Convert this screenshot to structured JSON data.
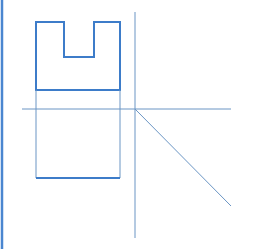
{
  "diagram": {
    "type": "orthographic-projection",
    "colors": {
      "thick": "#3d7cc9",
      "thin": "#6a95c4",
      "border": "#4a86d0",
      "background": "#ffffff"
    },
    "left_border": {
      "x": 2,
      "y1": 0,
      "y2": 249
    },
    "front_view_u_shape": {
      "points": [
        [
          36,
          22
        ],
        [
          64,
          22
        ],
        [
          64,
          57
        ],
        [
          94,
          57
        ],
        [
          94,
          22
        ],
        [
          120,
          22
        ],
        [
          120,
          90
        ],
        [
          36,
          90
        ]
      ]
    },
    "top_view_rect": {
      "x1": 36,
      "y1": 109,
      "x2": 120,
      "y2": 178
    },
    "projection_lines": {
      "left": {
        "x": 36,
        "y1": 90,
        "y2": 178
      },
      "right": {
        "x": 120,
        "y1": 90,
        "y2": 178
      }
    },
    "horizontal_axis": {
      "y": 109,
      "x1": 22,
      "x2": 231
    },
    "vertical_axis": {
      "x": 135,
      "y1": 12,
      "y2": 238
    },
    "miter_line": {
      "x1": 135,
      "y1": 109,
      "x2": 231,
      "y2": 206
    }
  }
}
